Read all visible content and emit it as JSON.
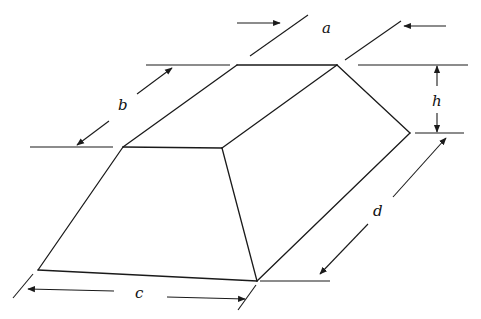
{
  "diagram": {
    "type": "frustum-pyramid-dimension-drawing",
    "colors": {
      "line": "#1a1a1a",
      "background": "#ffffff",
      "text": "#111111"
    },
    "labels": {
      "a": "a",
      "b": "b",
      "c": "c",
      "d": "d",
      "h": "h"
    },
    "dimensions": [
      {
        "id": "a",
        "description": "top face length (arrows pointing inward)"
      },
      {
        "id": "b",
        "description": "top face width (diagonal)"
      },
      {
        "id": "c",
        "description": "base length"
      },
      {
        "id": "d",
        "description": "base width (diagonal)"
      },
      {
        "id": "h",
        "description": "height"
      }
    ]
  }
}
